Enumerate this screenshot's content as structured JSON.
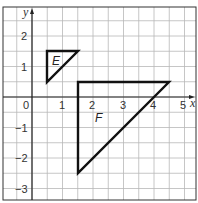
{
  "diagram": {
    "type": "coordinate-grid",
    "axes": {
      "x_label": "x",
      "y_label": "y"
    },
    "x_ticks": [
      "0",
      "1",
      "2",
      "3",
      "4",
      "5"
    ],
    "y_ticks": [
      "2",
      "1",
      "−1",
      "−2",
      "−3"
    ],
    "x_range": [
      -1,
      5.3
    ],
    "y_range": [
      -3.5,
      3
    ],
    "grid_step": 0.5,
    "shapes": [
      {
        "label": "E",
        "type": "triangle",
        "vertices": [
          [
            0.5,
            1.5
          ],
          [
            1.5,
            1.5
          ],
          [
            0.5,
            0.5
          ]
        ]
      },
      {
        "label": "F",
        "type": "triangle",
        "vertices": [
          [
            1.5,
            0.5
          ],
          [
            4.5,
            0.5
          ],
          [
            1.5,
            -2.5
          ]
        ]
      }
    ]
  }
}
